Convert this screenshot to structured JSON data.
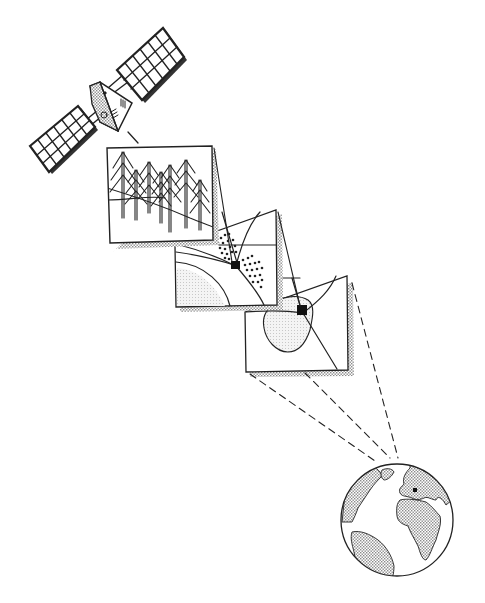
{
  "figure": {
    "colors": {
      "line": "#222222",
      "shade": "#bdbdbd",
      "land": "#d4d4d4",
      "lake": "#e8e8e8",
      "marker": "#111111",
      "background": "#ffffff"
    },
    "elements": [
      {
        "id": "satellite",
        "label": "satellite"
      },
      {
        "id": "panel-forest",
        "label": "forest close-up panel"
      },
      {
        "id": "panel-stand",
        "label": "forest stand panel"
      },
      {
        "id": "panel-region",
        "label": "regional map panel"
      },
      {
        "id": "globe",
        "label": "earth globe"
      }
    ]
  }
}
